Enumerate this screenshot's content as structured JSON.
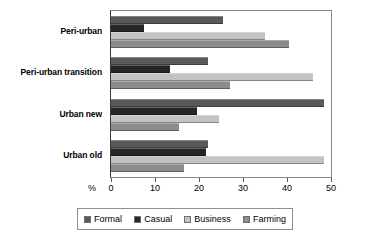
{
  "chart_data": {
    "type": "bar",
    "orientation": "horizontal",
    "title": "",
    "xlabel": "%",
    "ylabel": "",
    "xlim": [
      0,
      50
    ],
    "xticks": [
      0,
      10,
      20,
      30,
      40,
      50
    ],
    "xtick_labels": [
      "0",
      "10",
      "20",
      "30",
      "40",
      "50"
    ],
    "grid": false,
    "legend_position": "bottom",
    "categories": [
      "Peri-urban",
      "Peri-urban transition",
      "Urban new",
      "Urban old"
    ],
    "series": [
      {
        "name": "Formal",
        "color": "#595959",
        "values": [
          25.5,
          22.0,
          48.5,
          22.0
        ]
      },
      {
        "name": "Casual",
        "color": "#262626",
        "values": [
          7.5,
          13.5,
          19.5,
          21.5
        ]
      },
      {
        "name": "Business",
        "color": "#c3c3c3",
        "values": [
          35.0,
          46.0,
          24.5,
          48.5
        ]
      },
      {
        "name": "Farming",
        "color": "#8c8c8c",
        "values": [
          40.5,
          27.0,
          15.5,
          16.5
        ]
      }
    ]
  }
}
